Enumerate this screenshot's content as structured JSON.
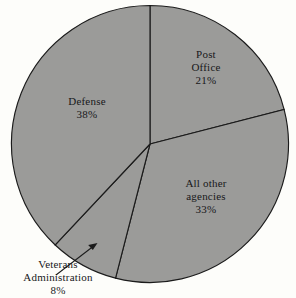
{
  "chart_data": {
    "type": "pie",
    "title": "",
    "subtitle": "",
    "xlabel": "",
    "ylabel": "",
    "legend_position": "none",
    "grid": false,
    "start_angle_deg": 0,
    "direction": "clockwise",
    "categories": [
      "Post Office",
      "All other agencies",
      "Veterans Administration",
      "Defense"
    ],
    "values": [
      21,
      33,
      8,
      38
    ],
    "value_unit": "%",
    "slices": [
      {
        "name": "Post Office",
        "label_lines": [
          "Post",
          "Office"
        ],
        "value": 21,
        "value_text": "21%",
        "color": "#9b9b99",
        "label_placement": "inside"
      },
      {
        "name": "All other agencies",
        "label_lines": [
          "All other",
          "agencies"
        ],
        "value": 33,
        "value_text": "33%",
        "color": "#9b9b99",
        "label_placement": "inside"
      },
      {
        "name": "Veterans Administration",
        "label_lines": [
          "Veterans",
          "Administration"
        ],
        "value": 8,
        "value_text": "8%",
        "color": "#9b9b99",
        "label_placement": "outside-with-leader"
      },
      {
        "name": "Defense",
        "label_lines": [
          "Defense"
        ],
        "value": 38,
        "value_text": "38%",
        "color": "#9b9b99",
        "label_placement": "inside"
      }
    ]
  },
  "labels": {
    "post_office": {
      "line1": "Post",
      "line2": "Office",
      "value": "21%"
    },
    "all_other": {
      "line1": "All other",
      "line2": "agencies",
      "value": "33%"
    },
    "veterans": {
      "line1": "Veterans",
      "line2": "Administration",
      "value": "8%"
    },
    "defense": {
      "line1": "Defense",
      "value": "38%"
    }
  },
  "style": {
    "slice_fill": "#9b9b99",
    "outline_color": "#1b1b1b",
    "background": "#fdfdfa",
    "text_color": "#18181a"
  }
}
